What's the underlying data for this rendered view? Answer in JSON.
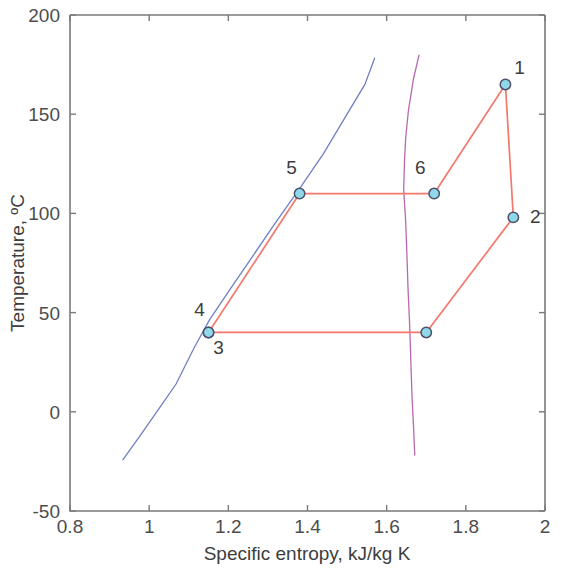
{
  "chart_data": {
    "type": "line",
    "title": "",
    "xlabel": "Specific entropy, kJ/kg K",
    "ylabel": "Temperature, ºC",
    "xlim": [
      0.8,
      2.0
    ],
    "ylim": [
      -50,
      200
    ],
    "grid": false,
    "legend": "none",
    "xticks": [
      0.8,
      1,
      1.2,
      1.4,
      1.6,
      1.8,
      2
    ],
    "xtick_labels": [
      "0.8",
      "1",
      "1.2",
      "1.4",
      "1.6",
      "1.8",
      "2"
    ],
    "yticks": [
      -50,
      0,
      50,
      100,
      150,
      200
    ],
    "ytick_labels": [
      "-50",
      "0",
      "50",
      "100",
      "150",
      "200"
    ],
    "series": [
      {
        "name": "saturated-liquid-line",
        "color": "#6f7fc4",
        "type": "line",
        "points": [
          [
            0.933,
            -24.4
          ],
          [
            0.975,
            -12.6
          ],
          [
            1.02,
            0.2
          ],
          [
            1.068,
            14.0
          ],
          [
            1.113,
            32.0
          ],
          [
            1.152,
            46.2
          ],
          [
            1.205,
            62.0
          ],
          [
            1.26,
            78.0
          ],
          [
            1.318,
            95.0
          ],
          [
            1.38,
            112.5
          ],
          [
            1.44,
            130.0
          ],
          [
            1.5,
            150.0
          ],
          [
            1.545,
            165.0
          ],
          [
            1.57,
            178.5
          ]
        ]
      },
      {
        "name": "saturated-vapor-line",
        "color": "#b868b0",
        "type": "line",
        "points": [
          [
            1.682,
            180.0
          ],
          [
            1.668,
            168.0
          ],
          [
            1.655,
            152.0
          ],
          [
            1.648,
            138.0
          ],
          [
            1.645,
            126.0
          ],
          [
            1.643,
            112.0
          ],
          [
            1.648,
            96.0
          ],
          [
            1.651,
            80.0
          ],
          [
            1.654,
            62.0
          ],
          [
            1.658,
            44.0
          ],
          [
            1.661,
            26.0
          ],
          [
            1.664,
            8.0
          ],
          [
            1.668,
            -8.0
          ],
          [
            1.671,
            -22.0
          ]
        ]
      },
      {
        "name": "refrigeration-cycle",
        "color": "#f4786b",
        "type": "line",
        "closed": true,
        "points": [
          [
            1.9,
            165
          ],
          [
            1.92,
            98
          ],
          [
            1.7,
            40
          ],
          [
            1.15,
            40
          ],
          [
            1.38,
            110
          ],
          [
            1.72,
            110
          ],
          [
            1.9,
            165
          ]
        ]
      }
    ],
    "state_points": [
      {
        "label": "1",
        "s": 1.9,
        "t": 165,
        "label_dx": 14,
        "label_dy": -10
      },
      {
        "label": "2",
        "s": 1.92,
        "t": 98,
        "label_dx": 22,
        "label_dy": 6
      },
      {
        "label": "3",
        "s": 1.15,
        "t": 40,
        "label_dx": 10,
        "label_dy": 22
      },
      {
        "label": "4",
        "s": 1.15,
        "t": 40,
        "label_dx": -9,
        "label_dy": -16
      },
      {
        "label": "5",
        "s": 1.38,
        "t": 110,
        "label_dx": -8,
        "label_dy": -20
      },
      {
        "label": "6",
        "s": 1.72,
        "t": 110,
        "label_dx": -14,
        "label_dy": -20
      },
      {
        "label": "",
        "s": 1.7,
        "t": 40,
        "label_dx": 0,
        "label_dy": 0
      }
    ]
  },
  "colors": {
    "liquid_line": "#6f7fc4",
    "vapor_line": "#b868b0",
    "cycle_line": "#f4786b",
    "marker_fill": "#8fd8ea",
    "marker_stroke": "#4f4f6b",
    "axis": "#7a7a7a",
    "text": "#3d3d3d",
    "background": "#ffffff"
  }
}
